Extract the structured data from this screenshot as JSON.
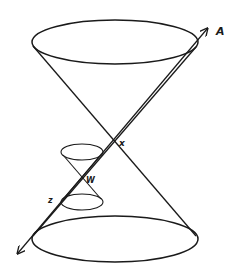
{
  "figure": {
    "type": "light-cone diagram",
    "stroke_color": "#1a1a1a",
    "background": "#ffffff"
  },
  "labels": {
    "axis_end": "A",
    "large_apex": "x",
    "small_apex": "W",
    "small_point": "z"
  },
  "geometry": {
    "large_cone": {
      "apex": [
        114,
        142
      ],
      "top_ellipse": {
        "cx": 115,
        "cy": 42,
        "rx": 83,
        "ry": 22
      },
      "bottom_ellipse": {
        "cx": 115,
        "cy": 239,
        "rx": 83,
        "ry": 23
      }
    },
    "small_cone": {
      "apex": [
        82,
        178
      ],
      "top_ellipse": {
        "cx": 82,
        "cy": 152,
        "rx": 21,
        "ry": 8
      },
      "bottom_ellipse": {
        "cx": 82,
        "cy": 202,
        "rx": 21,
        "ry": 8
      }
    },
    "axis": {
      "start": [
        18,
        253
      ],
      "end": [
        207,
        29
      ]
    }
  }
}
